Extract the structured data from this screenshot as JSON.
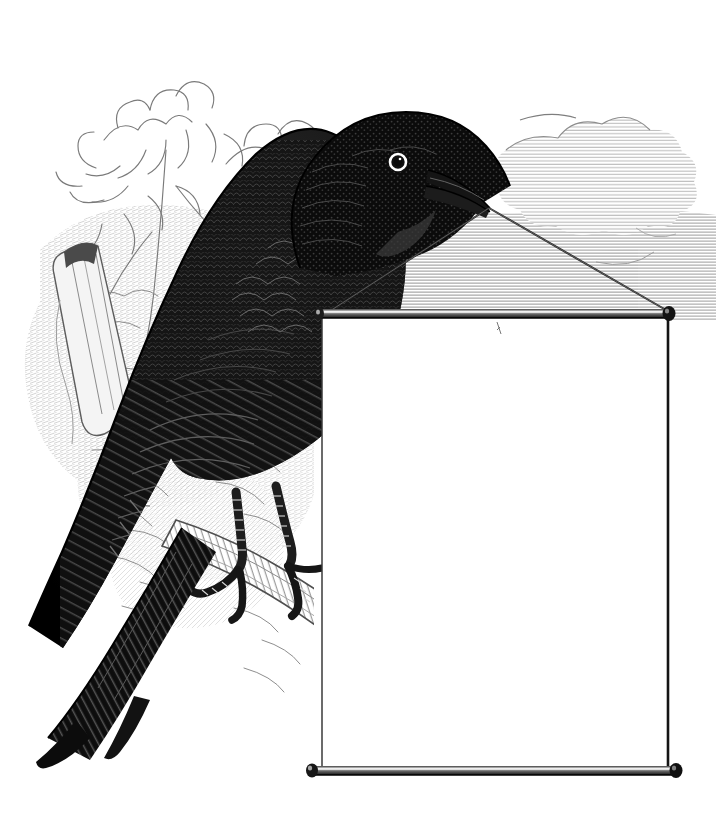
{
  "image": {
    "kind": "vintage-wood-engraving",
    "medium": "black-and-white line engraving",
    "canvas": {
      "width": 716,
      "height": 829,
      "background": "#ffffff"
    },
    "palette": {
      "ink": "#111111",
      "bird_black": "#1a1a1a",
      "bird_shadow": "#000000",
      "foliage_line": "#7d7d7d",
      "foliage_light": "#b9b9b9",
      "sky_hatch": "#a9a9a9",
      "cloud_hatch": "#bcbcbc",
      "rod_dark": "#2b2b2b",
      "rod_highlight": "#e8e8e8",
      "banner_fill": "#ffffff",
      "banner_edge": "#1c1c1c",
      "string": "#2a2a2a",
      "branch_light": "#cfcfcf",
      "paper": "#ffffff"
    }
  },
  "subject": {
    "name": "blackbird",
    "label": "Black bird perched on a branch holding a blank hanging sign by a string in its beak",
    "pose": "perched, facing right, head turned right",
    "eye": {
      "type": "ring-eye",
      "iris": "#ffffff",
      "pupil": "#101010"
    },
    "beak": {
      "type": "long-pointed-beak",
      "color": "#1a1a1a"
    },
    "feet": {
      "type": "scaled-talons",
      "count": 2,
      "grip": "branch"
    }
  },
  "scene": {
    "foliage": {
      "name": "leafy-branch",
      "position": "upper-left",
      "style": "fine-outline-engraving"
    },
    "stump": {
      "name": "broken-branch-stub",
      "position": "left"
    },
    "perch": {
      "name": "branch",
      "position": "lower-center-left"
    },
    "sky": {
      "name": "sky-hatching",
      "position": "upper-right"
    },
    "clouds": {
      "name": "cloud",
      "position": "upper-right",
      "style": "horizontal-hatching"
    }
  },
  "banner": {
    "name": "blank-hanging-sign",
    "text": "",
    "placeholder": "",
    "rect": {
      "x": 322,
      "y": 312,
      "width": 348,
      "height": 462
    },
    "top_rod": {
      "name": "top-rod",
      "x1": 318,
      "x2": 676,
      "y": 315
    },
    "bottom_rod": {
      "name": "bottom-rod",
      "x1": 310,
      "x2": 678,
      "y": 771
    },
    "end_knobs": 4,
    "strings": [
      {
        "name": "string-left",
        "from": [
          489,
          206
        ],
        "to": [
          330,
          312
        ]
      },
      {
        "name": "string-right",
        "from": [
          489,
          206
        ],
        "to": [
          668,
          311
        ]
      }
    ]
  }
}
